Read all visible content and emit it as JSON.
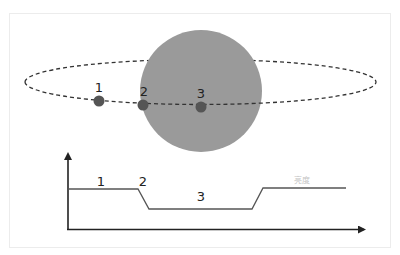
{
  "diagram": {
    "title": "",
    "colors": {
      "planet_fill": "#9a9a9a",
      "point_fill": "#555555",
      "orbit_stroke": "#333333",
      "axis_stroke": "#222222",
      "curve_stroke": "#555555",
      "faint_label": "#c4c4c4"
    },
    "orbit": {
      "points": [
        {
          "label": "1"
        },
        {
          "label": "2"
        },
        {
          "label": "3"
        }
      ]
    },
    "light_curve": {
      "segment_labels": [
        {
          "label": "1"
        },
        {
          "label": "2"
        },
        {
          "label": "3"
        }
      ],
      "y_axis_label": "亮度"
    }
  }
}
